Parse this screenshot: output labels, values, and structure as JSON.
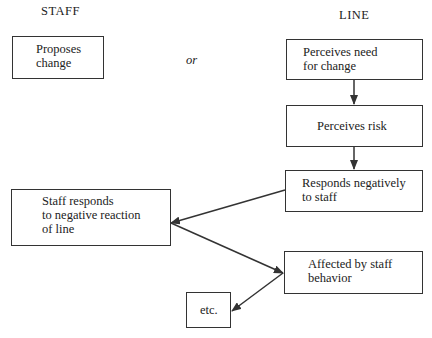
{
  "headers": {
    "staff": "STAFF",
    "line": "LINE"
  },
  "connector_text": "or",
  "nodes": {
    "proposes_change": "Proposes\nchange",
    "perceives_need": "Perceives need\nfor change",
    "perceives_risk": "Perceives risk",
    "responds_negatively": "Responds negatively\nto staff",
    "staff_responds": "Staff responds\nto negative reaction\nof line",
    "affected_by_staff": "Affected by staff\nbehavior",
    "etc": "etc."
  },
  "edges": [
    {
      "from": "perceives_need",
      "to": "perceives_risk"
    },
    {
      "from": "perceives_risk",
      "to": "responds_negatively"
    },
    {
      "from": "responds_negatively",
      "to": "staff_responds"
    },
    {
      "from": "staff_responds",
      "to": "affected_by_staff"
    },
    {
      "from": "affected_by_staff",
      "to": "etc"
    }
  ],
  "colors": {
    "line": "#333333",
    "background": "#ffffff"
  }
}
